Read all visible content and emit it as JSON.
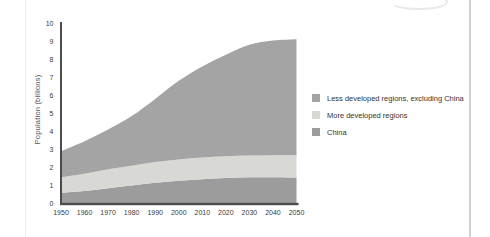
{
  "chart_data": {
    "type": "area",
    "stacked": true,
    "title": "",
    "xlabel": "",
    "ylabel": "Population (billions)",
    "ylim": [
      0,
      10
    ],
    "grid": false,
    "legend_position": "right",
    "years": [
      1950,
      1960,
      1970,
      1980,
      1990,
      2000,
      2010,
      2020,
      2030,
      2040,
      2050
    ],
    "x_ticks": [
      "1950",
      "1960",
      "1970",
      "1980",
      "1990",
      "2000",
      "2010",
      "2020",
      "2030",
      "2040",
      "2050"
    ],
    "y_ticks": [
      "0",
      "1",
      "2",
      "3",
      "4",
      "5",
      "6",
      "7",
      "8",
      "9",
      "10"
    ],
    "series": [
      {
        "name": "China",
        "color": "#9c9c9c",
        "values": [
          0.6,
          0.7,
          0.85,
          1.0,
          1.15,
          1.27,
          1.35,
          1.42,
          1.46,
          1.46,
          1.44
        ]
      },
      {
        "name": "More developed regions",
        "color": "#d8d8d5",
        "values": [
          0.85,
          0.95,
          1.05,
          1.1,
          1.15,
          1.18,
          1.2,
          1.2,
          1.2,
          1.22,
          1.24
        ]
      },
      {
        "name": "Less developed regions, excluding China",
        "color": "#a4a4a4",
        "values": [
          1.45,
          1.8,
          2.2,
          2.75,
          3.5,
          4.35,
          5.05,
          5.63,
          6.14,
          6.35,
          6.42
        ]
      }
    ],
    "totals": [
      2.9,
      3.45,
      4.1,
      4.85,
      5.8,
      6.8,
      7.6,
      8.25,
      8.8,
      9.03,
      9.1
    ],
    "legend_entries": [
      {
        "label": "Less developed regions, excluding China",
        "color": "#a4a4a4"
      },
      {
        "label": "More developed regions",
        "color": "#d8d8d5"
      },
      {
        "label": "China",
        "color": "#9c9c9c"
      }
    ],
    "axis_color": "#4b4b4b",
    "tick_label_color": "#3a3a3a"
  }
}
